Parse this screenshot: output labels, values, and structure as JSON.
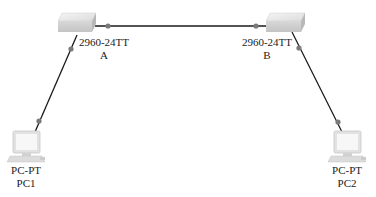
{
  "diagram": {
    "type": "network-topology",
    "nodes": [
      {
        "id": "A",
        "kind": "switch",
        "model": "2960-24TT",
        "name": "A",
        "x": 76,
        "y": 23
      },
      {
        "id": "B",
        "kind": "switch",
        "model": "2960-24TT",
        "name": "B",
        "x": 285,
        "y": 23
      },
      {
        "id": "PC1",
        "kind": "pc",
        "model": "PC-PT",
        "name": "PC1",
        "x": 26,
        "y": 146
      },
      {
        "id": "PC2",
        "kind": "pc",
        "model": "PC-PT",
        "name": "PC2",
        "x": 347,
        "y": 146
      }
    ],
    "links": [
      {
        "from": "A",
        "to": "B"
      },
      {
        "from": "A",
        "to": "PC1"
      },
      {
        "from": "B",
        "to": "PC2"
      }
    ]
  },
  "labels": {
    "switch_a_model": "2960-24TT",
    "switch_a_name": "A",
    "switch_b_model": "2960-24TT",
    "switch_b_name": "B",
    "pc1_model": "PC-PT",
    "pc1_name": "PC1",
    "pc2_model": "PC-PT",
    "pc2_name": "PC2"
  },
  "colors": {
    "link": "#1a1a1a",
    "port_dot": "#7a7a7a",
    "device_face": "#e6e6e6",
    "device_shadow": "#bdbdbd"
  }
}
